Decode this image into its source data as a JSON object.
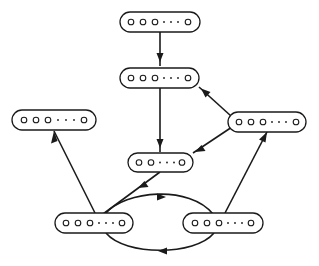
{
  "diagram": {
    "type": "directed-graph",
    "node_label_glyph": "o o o · · · o",
    "nodes": [
      {
        "id": "top",
        "x": 120,
        "y": 12,
        "w": 80,
        "h": 20,
        "circles_before_ellipsis": 3
      },
      {
        "id": "second",
        "x": 120,
        "y": 68,
        "w": 79,
        "h": 20,
        "circles_before_ellipsis": 3
      },
      {
        "id": "left",
        "x": 12,
        "y": 110,
        "w": 84,
        "h": 20,
        "circles_before_ellipsis": 3
      },
      {
        "id": "right",
        "x": 228,
        "y": 112,
        "w": 78,
        "h": 20,
        "circles_before_ellipsis": 3
      },
      {
        "id": "middle",
        "x": 128,
        "y": 153,
        "w": 65,
        "h": 19,
        "circles_before_ellipsis": 2
      },
      {
        "id": "bottom-left",
        "x": 55,
        "y": 213,
        "w": 78,
        "h": 20,
        "circles_before_ellipsis": 3
      },
      {
        "id": "bottom-right",
        "x": 183,
        "y": 213,
        "w": 80,
        "h": 20,
        "circles_before_ellipsis": 3
      }
    ],
    "edges": [
      {
        "from": "top",
        "to": "second"
      },
      {
        "from": "second",
        "to": "middle"
      },
      {
        "from": "right",
        "to": "second"
      },
      {
        "from": "right",
        "to": "middle"
      },
      {
        "from": "middle",
        "to": "bottom-left"
      },
      {
        "from": "bottom-left",
        "to": "left"
      },
      {
        "from": "bottom-right",
        "to": "right"
      },
      {
        "from": "bottom-left",
        "to": "bottom-right",
        "shape": "upper-arc"
      },
      {
        "from": "bottom-right",
        "to": "bottom-left",
        "shape": "lower-arc"
      }
    ],
    "colors": {
      "stroke": "#1a1a1a",
      "background": "#ffffff"
    }
  }
}
